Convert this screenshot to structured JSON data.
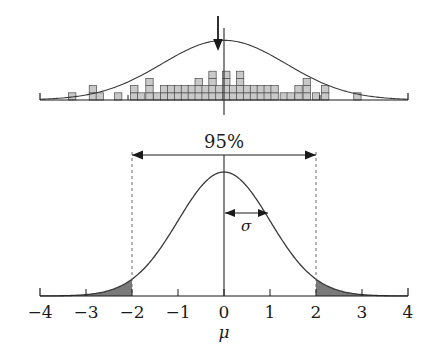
{
  "chart_data": [
    {
      "type": "bar",
      "id": "top-histogram",
      "title": "",
      "xlabel": "",
      "ylabel": "",
      "xlim": [
        -4,
        4
      ],
      "ylim": [
        0,
        6
      ],
      "grid": false,
      "legend": null,
      "bin_width": 0.16,
      "categories": [
        -3.3,
        -2.85,
        -2.7,
        -2.3,
        -1.95,
        -1.8,
        -1.62,
        -1.45,
        -1.3,
        -1.15,
        -1.0,
        -0.85,
        -0.7,
        -0.55,
        -0.4,
        -0.25,
        -0.1,
        0.05,
        0.2,
        0.35,
        0.5,
        0.65,
        0.8,
        0.95,
        1.1,
        1.3,
        1.45,
        1.62,
        1.8,
        2.0,
        2.2,
        2.9
      ],
      "values": [
        1,
        2,
        1,
        1,
        2,
        1,
        3,
        1,
        2,
        2,
        2,
        2,
        2,
        3,
        2,
        4,
        2,
        4,
        2,
        4,
        2,
        2,
        2,
        2,
        2,
        1,
        1,
        2,
        3,
        1,
        2,
        1
      ],
      "overlay_curve": {
        "type": "normal",
        "mean": 0,
        "sd": 1.35,
        "peak_value": 5.6
      },
      "annotations": [
        {
          "name": "sample-mean-arrow",
          "label": "",
          "x": -0.12,
          "direction": "down"
        },
        {
          "name": "center-line",
          "label": "",
          "x": 0.0
        }
      ],
      "axis_ticks": [
        -4,
        -2.45,
        0,
        2.45,
        4
      ],
      "tick_labels": [
        "",
        "",
        "",
        "",
        ""
      ]
    },
    {
      "type": "line",
      "id": "bottom-normal-curve",
      "title": "",
      "xlabel": "μ",
      "ylabel": "",
      "xlim": [
        -4,
        4
      ],
      "ylim": [
        0,
        0.42
      ],
      "grid": false,
      "legend": null,
      "distribution": {
        "type": "normal",
        "mean": 0,
        "sd": 1
      },
      "x": [
        -4.0,
        -3.5,
        -3.0,
        -2.5,
        -2.0,
        -1.5,
        -1.0,
        -0.5,
        0.0,
        0.5,
        1.0,
        1.5,
        2.0,
        2.5,
        3.0,
        3.5,
        4.0
      ],
      "y": [
        0.0001,
        0.0009,
        0.0044,
        0.0175,
        0.054,
        0.1295,
        0.242,
        0.3521,
        0.3989,
        0.3521,
        0.242,
        0.1295,
        0.054,
        0.0175,
        0.0044,
        0.0009,
        0.0001
      ],
      "shaded_regions": [
        {
          "name": "left-tail",
          "from": -4,
          "to": -2,
          "area": 0.025,
          "color": "#7a7a7a"
        },
        {
          "name": "right-tail",
          "from": 2,
          "to": 4,
          "area": 0.025,
          "color": "#7a7a7a"
        }
      ],
      "annotations": [
        {
          "name": "confidence-interval-label",
          "label": "95%",
          "from": -2,
          "to": 2,
          "kind": "double-arrow"
        },
        {
          "name": "sigma-label",
          "label": "σ",
          "from": 0,
          "to": 1,
          "kind": "double-arrow"
        },
        {
          "name": "center-line",
          "label": "",
          "x": 0.0
        },
        {
          "name": "ci-bound-left",
          "label": "",
          "x": -2,
          "kind": "dashed-vertical"
        },
        {
          "name": "ci-bound-right",
          "label": "",
          "x": 2,
          "kind": "dashed-vertical"
        }
      ],
      "axis_ticks": [
        -4,
        -3,
        -2,
        -1,
        0,
        1,
        2,
        3,
        4
      ],
      "tick_labels": [
        "−4",
        "−3",
        "−2",
        "−1",
        "0",
        "1",
        "2",
        "3",
        "4"
      ]
    }
  ],
  "colors": {
    "ink": "#1a1a1a",
    "curve": "#3a3a3a",
    "bar_fill": "#c9c9c9",
    "bar_stroke": "#4a4a4a",
    "tail_fill": "#7a7a7a",
    "background": "#ffffff"
  },
  "labels": {
    "confidence": "95%",
    "sigma": "σ",
    "mu": "μ",
    "ticks": [
      "−4",
      "−3",
      "−2",
      "−1",
      "0",
      "1",
      "2",
      "3",
      "4"
    ]
  }
}
